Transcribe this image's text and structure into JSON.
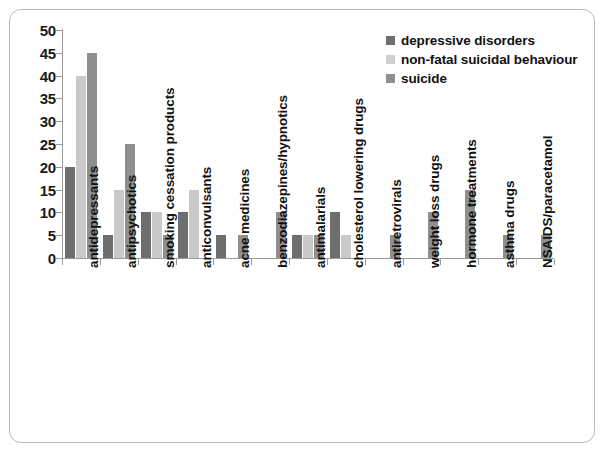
{
  "chart_data": {
    "type": "bar",
    "title": "",
    "subtitle": "",
    "xlabel": "",
    "ylabel": "",
    "ylim": [
      0,
      50
    ],
    "ytick_step": 5,
    "yticks": [
      50,
      45,
      40,
      35,
      30,
      25,
      20,
      15,
      10,
      5,
      0
    ],
    "grid": false,
    "legend_position": "top-right",
    "categories": [
      "antidepressants",
      "antipsychotics",
      "smoking cessation products",
      "anticonvulsants",
      "acne medicines",
      "benzodiazepines/hypnotics",
      "antimalarials",
      "cholesterol lowering drugs",
      "antiretrovirals",
      "weight loss drugs",
      "hormone treatments",
      "asthma drugs",
      "NSAIDS/paracetamol"
    ],
    "series": [
      {
        "name": "depressive disorders",
        "color": "#6e6e6e",
        "values": [
          20,
          5,
          10,
          10,
          5,
          0,
          5,
          10,
          0,
          0,
          0,
          0,
          0
        ]
      },
      {
        "name": "non-fatal suicidal behaviour",
        "color": "#c9c9c9",
        "values": [
          40,
          15,
          10,
          15,
          0,
          0,
          5,
          5,
          0,
          0,
          0,
          0,
          0
        ]
      },
      {
        "name": "suicide",
        "color": "#8f8f8f",
        "values": [
          45,
          25,
          5,
          0,
          5,
          10,
          5,
          0,
          5,
          10,
          15,
          5,
          5
        ]
      }
    ]
  },
  "legend": {
    "items": [
      {
        "label": "depressive disorders"
      },
      {
        "label": "non-fatal suicidal behaviour"
      },
      {
        "label": "suicide"
      }
    ]
  }
}
